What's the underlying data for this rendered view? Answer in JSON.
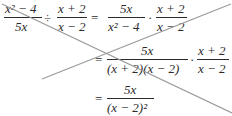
{
  "expression": {
    "line1": {
      "lhs_fraction_1": {
        "numerator": "x² − 4",
        "denominator": "5x"
      },
      "operator_divide": "÷",
      "lhs_fraction_2": {
        "numerator": "x + 2",
        "denominator": "x − 2"
      },
      "equals": "=",
      "rhs_fraction_1": {
        "numerator": "5x",
        "denominator": "x² − 4"
      },
      "operator_times": "·",
      "rhs_fraction_2": {
        "numerator": "x + 2",
        "denominator": "x − 2"
      }
    },
    "line2": {
      "equals": "=",
      "fraction_1": {
        "numerator": "5x",
        "denominator": "(x + 2)(x − 2)"
      },
      "operator_times": "·",
      "fraction_2": {
        "numerator": "x + 2",
        "denominator": "x − 2"
      }
    },
    "line3": {
      "equals": "=",
      "fraction": {
        "numerator": "5x",
        "denominator": "(x − 2)²"
      }
    }
  },
  "annotation": {
    "type": "cross-out",
    "color": "#9a9a9a",
    "lines": [
      {
        "x1": 2,
        "y1": 4,
        "x2": 232,
        "y2": 113
      },
      {
        "x1": 42,
        "y1": 79,
        "x2": 231,
        "y2": 4
      }
    ]
  }
}
